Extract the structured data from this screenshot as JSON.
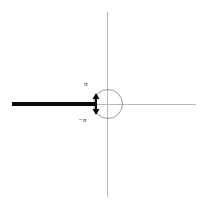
{
  "figure": {
    "width": 209,
    "height": 208,
    "background_color": "#ffffff"
  },
  "axes": {
    "x_axis": {
      "name": "real-axis",
      "color": "#b8b8b8",
      "x_start": 12,
      "x_end": 196,
      "y": 104
    },
    "y_axis": {
      "name": "imaginary-axis",
      "color": "#b8b8b8",
      "x": 107,
      "y_start": 12,
      "y_end": 197
    },
    "origin": {
      "x": 107,
      "y": 104
    }
  },
  "elements": {
    "branch_cut": {
      "description": "thick black ray along the negative real axis",
      "color": "#0a0a0a",
      "thickness": 4,
      "x_start": 12,
      "x_end": 96,
      "y": 104
    },
    "unit_circle": {
      "description": "circle centered at the origin",
      "color": "#9a9a9a",
      "center_x": 108,
      "center_y": 104,
      "radius": 15
    },
    "arrow_head": {
      "description": "double arrow at the terminal point of the branch cut indicating the jump of the argument",
      "color": "#0a0a0a",
      "x": 96,
      "y": 104
    }
  },
  "labels": {
    "upper": {
      "text": "π",
      "name": "pi-label",
      "x": 87,
      "y": 84
    },
    "lower": {
      "text": "−π",
      "name": "negative-pi-label",
      "x": 85,
      "y": 120
    }
  }
}
